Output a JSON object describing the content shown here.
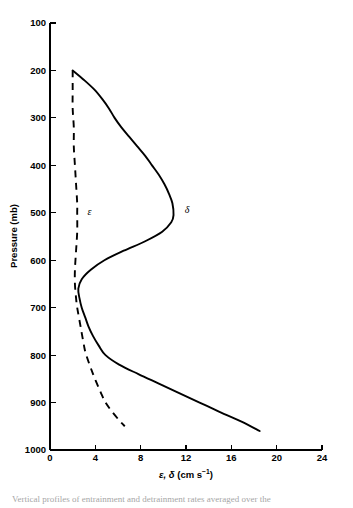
{
  "figure": {
    "curve_label_epsilon": "ε",
    "curve_label_delta": "δ",
    "caption_fragment": "Vertical profiles of entrainment and detrainment rates averaged over the"
  },
  "axes": {
    "y_title": "Pressure (mb)",
    "x_title_prefix": "ε, ",
    "x_title_italic": "δ",
    "x_title_unit": " (cm s",
    "x_title_sup": "−1",
    "x_title_close": ")",
    "y_ticks": [
      "100",
      "200",
      "300",
      "400",
      "500",
      "600",
      "700",
      "800",
      "900",
      "1000"
    ],
    "x_ticks": [
      "0",
      "4",
      "8",
      "12",
      "16",
      "20",
      "24"
    ]
  },
  "chart_data": {
    "type": "line",
    "title": "",
    "xlabel": "ε, δ (cm s⁻¹)",
    "ylabel": "Pressure (mb)",
    "xlim": [
      0,
      24
    ],
    "ylim": [
      1000,
      100
    ],
    "y_inverted": true,
    "grid": false,
    "legend": "inline-curve-labels",
    "x_ticks": [
      0,
      4,
      8,
      12,
      16,
      20,
      24
    ],
    "y_ticks": [
      100,
      200,
      300,
      400,
      500,
      600,
      700,
      800,
      900,
      1000
    ],
    "units": {
      "x": "cm s^-1",
      "y": "mb"
    },
    "series": [
      {
        "name": "δ",
        "label": "δ",
        "style": "solid",
        "description": "detrainment rate profile",
        "points": [
          {
            "p": 200,
            "v": 2.0
          },
          {
            "p": 220,
            "v": 3.0
          },
          {
            "p": 240,
            "v": 3.9
          },
          {
            "p": 260,
            "v": 4.6
          },
          {
            "p": 280,
            "v": 5.2
          },
          {
            "p": 300,
            "v": 5.7
          },
          {
            "p": 320,
            "v": 6.3
          },
          {
            "p": 340,
            "v": 7.0
          },
          {
            "p": 360,
            "v": 7.7
          },
          {
            "p": 380,
            "v": 8.4
          },
          {
            "p": 400,
            "v": 9.0
          },
          {
            "p": 420,
            "v": 9.6
          },
          {
            "p": 440,
            "v": 10.1
          },
          {
            "p": 460,
            "v": 10.5
          },
          {
            "p": 480,
            "v": 10.8
          },
          {
            "p": 505,
            "v": 10.9
          },
          {
            "p": 520,
            "v": 10.7
          },
          {
            "p": 540,
            "v": 9.9
          },
          {
            "p": 560,
            "v": 8.4
          },
          {
            "p": 580,
            "v": 6.5
          },
          {
            "p": 600,
            "v": 4.8
          },
          {
            "p": 620,
            "v": 3.6
          },
          {
            "p": 640,
            "v": 2.8
          },
          {
            "p": 660,
            "v": 2.5
          },
          {
            "p": 680,
            "v": 2.6
          },
          {
            "p": 700,
            "v": 2.8
          },
          {
            "p": 720,
            "v": 3.1
          },
          {
            "p": 740,
            "v": 3.4
          },
          {
            "p": 760,
            "v": 3.8
          },
          {
            "p": 780,
            "v": 4.3
          },
          {
            "p": 800,
            "v": 4.9
          },
          {
            "p": 820,
            "v": 6.1
          },
          {
            "p": 840,
            "v": 7.8
          },
          {
            "p": 860,
            "v": 9.6
          },
          {
            "p": 880,
            "v": 11.4
          },
          {
            "p": 900,
            "v": 13.2
          },
          {
            "p": 920,
            "v": 15.0
          },
          {
            "p": 940,
            "v": 16.9
          },
          {
            "p": 960,
            "v": 18.5
          }
        ]
      },
      {
        "name": "ε",
        "label": "ε",
        "style": "dashed",
        "description": "entrainment rate profile",
        "points": [
          {
            "p": 200,
            "v": 2.0
          },
          {
            "p": 240,
            "v": 2.0
          },
          {
            "p": 280,
            "v": 2.0
          },
          {
            "p": 320,
            "v": 2.1
          },
          {
            "p": 360,
            "v": 2.1
          },
          {
            "p": 400,
            "v": 2.2
          },
          {
            "p": 440,
            "v": 2.3
          },
          {
            "p": 480,
            "v": 2.4
          },
          {
            "p": 500,
            "v": 2.4
          },
          {
            "p": 540,
            "v": 2.4
          },
          {
            "p": 580,
            "v": 2.3
          },
          {
            "p": 620,
            "v": 2.2
          },
          {
            "p": 650,
            "v": 2.2
          },
          {
            "p": 680,
            "v": 2.3
          },
          {
            "p": 700,
            "v": 2.4
          },
          {
            "p": 740,
            "v": 2.7
          },
          {
            "p": 780,
            "v": 3.0
          },
          {
            "p": 800,
            "v": 3.2
          },
          {
            "p": 840,
            "v": 3.8
          },
          {
            "p": 880,
            "v": 4.5
          },
          {
            "p": 900,
            "v": 4.9
          },
          {
            "p": 920,
            "v": 5.5
          },
          {
            "p": 940,
            "v": 6.2
          },
          {
            "p": 950,
            "v": 6.6
          }
        ]
      }
    ],
    "annotations": [
      {
        "text": "ε",
        "p": 505,
        "v": 3.3
      },
      {
        "text": "δ",
        "p": 500,
        "v": 11.9
      }
    ]
  }
}
